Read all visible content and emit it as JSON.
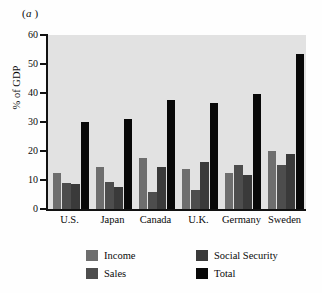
{
  "figure": {
    "panel_label_prefix": "(",
    "panel_label": "a",
    "panel_label_suffix": " )"
  },
  "chart_data": {
    "type": "bar",
    "title": "",
    "subtitle": "",
    "xlabel": "",
    "ylabel": "% of GDP",
    "ylim": [
      0,
      60
    ],
    "yticks": [
      0,
      10,
      20,
      30,
      40,
      50,
      60
    ],
    "ytick_labels": [
      "0",
      "10",
      "20",
      "30",
      "40",
      "50",
      "60"
    ],
    "grid": false,
    "legend_position": "bottom",
    "plot_background": "#e2e2e2",
    "categories": [
      "U.S.",
      "Japan",
      "Canada",
      "U.K.",
      "Germany",
      "Sweden"
    ],
    "series": [
      {
        "name": "Income",
        "color": "#6e6e6e",
        "values": [
          12.5,
          14.5,
          17.5,
          13.7,
          12.3,
          20.1
        ]
      },
      {
        "name": "Sales",
        "color": "#4d4d4d",
        "values": [
          9.0,
          9.4,
          6.0,
          6.6,
          15.3,
          15.1
        ]
      },
      {
        "name": "Social Security",
        "color": "#3a3a3a",
        "values": [
          8.5,
          7.5,
          14.5,
          16.1,
          11.9,
          19.0
        ]
      },
      {
        "name": "Total",
        "color": "#080808",
        "values": [
          30.0,
          31.0,
          37.5,
          36.5,
          39.8,
          53.6
        ]
      }
    ]
  },
  "legend": {
    "items": [
      {
        "label": "Income",
        "color": "#6e6e6e"
      },
      {
        "label": "Sales",
        "color": "#4d4d4d"
      },
      {
        "label": "Social Security",
        "color": "#3a3a3a"
      },
      {
        "label": "Total",
        "color": "#080808"
      }
    ]
  }
}
